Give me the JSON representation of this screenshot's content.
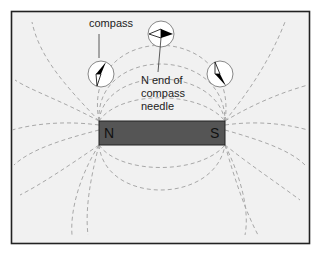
{
  "diagram": {
    "colors": {
      "background": "#f1f1f1",
      "frame": "#222222",
      "field_line": "#a8a8a8",
      "magnet": "#555555",
      "compass_face": "#ffffff",
      "needle_north": "#000000",
      "needle_south": "#ffffff"
    },
    "magnet": {
      "north_label": "N",
      "south_label": "S"
    },
    "labels": {
      "compass": "compass",
      "needle_line1": "N end of",
      "needle_line2": "compass",
      "needle_line3": "needle"
    },
    "compasses": [
      {
        "name": "left",
        "cx": 101,
        "cy": 74,
        "r": 13
      },
      {
        "name": "top",
        "cx": 161,
        "cy": 34,
        "r": 13
      },
      {
        "name": "right",
        "cx": 220,
        "cy": 74,
        "r": 13
      }
    ]
  }
}
